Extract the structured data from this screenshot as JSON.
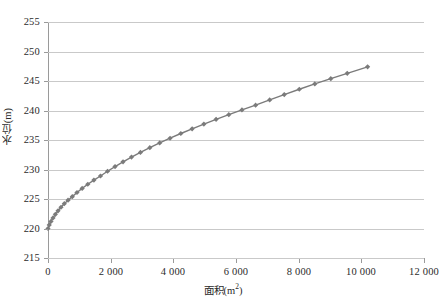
{
  "chart_data": {
    "type": "line",
    "title": "",
    "subtitle": "",
    "xlabel": "面积(m²)",
    "ylabel": "水位(m)",
    "xlabel_text": "面积(m",
    "xlabel_sup": "2",
    "xlabel_tail": ")",
    "ylim": [
      215,
      255
    ],
    "xlim": [
      0,
      12000
    ],
    "grid": true,
    "legend": false,
    "marker": "diamond",
    "series_color": "#7b7b7b",
    "gridline_color": "#c9c9c9",
    "axis_color": "#9a9a9a",
    "background": "#ffffff",
    "y_ticks": [
      215,
      220,
      225,
      230,
      235,
      240,
      245,
      250,
      255
    ],
    "y_tick_labels": [
      "215",
      "220",
      "225",
      "230",
      "235",
      "240",
      "245",
      "250",
      "255"
    ],
    "x_ticks": [
      0,
      2000,
      4000,
      6000,
      8000,
      10000,
      12000
    ],
    "x_tick_labels": [
      "0",
      "2 000",
      "4 000",
      "6 000",
      "8 000",
      "10 000",
      "12 000"
    ],
    "series": [
      {
        "name": "水位-面积关系曲线",
        "x": [
          0,
          40,
          95,
          160,
          235,
          320,
          415,
          520,
          640,
          775,
          925,
          1090,
          1270,
          1465,
          1675,
          1900,
          2140,
          2395,
          2665,
          2950,
          3250,
          3565,
          3895,
          4240,
          4600,
          4975,
          5365,
          5770,
          6190,
          6625,
          7075,
          7540,
          8020,
          8515,
          9025,
          9550,
          10200
        ],
        "y": [
          220.0,
          220.6,
          221.2,
          221.8,
          222.4,
          223.0,
          223.6,
          224.2,
          224.8,
          225.4,
          226.1,
          226.8,
          227.5,
          228.2,
          228.9,
          229.7,
          230.5,
          231.3,
          232.1,
          232.9,
          233.7,
          234.5,
          235.3,
          236.1,
          236.9,
          237.7,
          238.5,
          239.3,
          240.1,
          240.9,
          241.8,
          242.7,
          243.6,
          244.5,
          245.4,
          246.3,
          247.4
        ]
      }
    ]
  },
  "curve": {
    "description": "水位-面积关系曲线",
    "start_point": {
      "x": 0,
      "y": 220.0
    },
    "end_point": {
      "x": 10200,
      "y": 252.3
    }
  }
}
